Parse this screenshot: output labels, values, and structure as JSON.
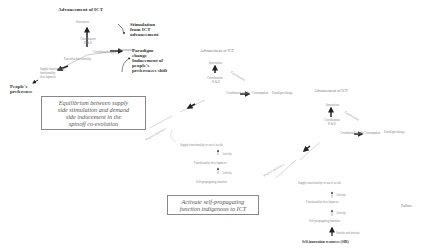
{
  "diagram1": {
    "top_title": "Advancement of ICT",
    "node_top": "Innovation",
    "node_center": "Coordination",
    "node_center_sub": "R & D",
    "node_right_a": "Coordinated supply",
    "node_right_b": "Consumption",
    "node_left_a": "Extended functionality",
    "node_left_b": "Supply functionality, functionality development",
    "annotation_stimulation": [
      "Stimulation",
      "from ICT",
      "advancement"
    ],
    "annotation_paradigm": [
      "Paradigm",
      "change"
    ],
    "annotation_inducement": [
      "Inducement of",
      "people's",
      "preferences shift"
    ],
    "annotation_people": [
      "People's",
      "preference"
    ],
    "box_text": [
      "Equilibrium between supply",
      "side stimulation and demand",
      "side inducement in the",
      "spinoff co-evolution"
    ]
  },
  "diagram2": {
    "top_title": "Advancement of ICT",
    "node_top": "Innovation",
    "node_center": "Coordination",
    "node_center_sub": "R & D",
    "node_right_a": "Coordinated supply",
    "node_right_b": "Consumption",
    "paradigm": "Paradigm change",
    "diag_label": "Functionality",
    "left_label": "People's preference",
    "chain": [
      "Supply functionality to users' needs",
      "Functionality development",
      "Self-propagating function"
    ],
    "chain_arrows": [
      "Activity",
      "Activity"
    ],
    "box_text": [
      "Activate self-propagating",
      "function indigenous to ICT"
    ]
  },
  "diagram3": {
    "top_title": "Advancement of ICT",
    "node_top": "Innovation",
    "node_center": "Coordination",
    "node_center_sub": "R & D",
    "node_right_a": "Coordinated supply",
    "node_right_b": "Consumption",
    "paradigm": "Paradigm change",
    "diag_label": "Functionality",
    "left_label": "People's preference",
    "chain": [
      "Supply functionality to users' needs",
      "Functionality development",
      "Self-propagating function",
      "Self-innovation resources (SIR)"
    ],
    "chain_arrows": [
      "Activity",
      "Activity",
      "Sustain and activate"
    ],
    "side_label": "Failure"
  }
}
